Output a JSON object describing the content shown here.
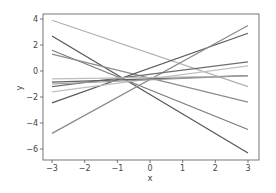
{
  "chart_data": {
    "type": "line",
    "title": "",
    "xlabel": "x",
    "ylabel": "y",
    "xlim": [
      -3.3,
      3.3
    ],
    "ylim": [
      -6.8,
      4.4
    ],
    "x_ticks": [
      -3,
      -2,
      -1,
      0,
      1,
      2,
      3
    ],
    "y_ticks": [
      4,
      2,
      0,
      -2,
      -4,
      -6
    ],
    "x_tick_labels": [
      "−3",
      "−2",
      "−1",
      "0",
      "1",
      "2",
      "3"
    ],
    "y_tick_labels": [
      "4",
      "2",
      "0",
      "−2",
      "−4",
      "−6"
    ],
    "grid": false,
    "legend": null,
    "x": [
      -3,
      3
    ],
    "series": [
      {
        "name": "line1",
        "values": [
          3.9,
          -1.2
        ],
        "color": "#b0b0b0"
      },
      {
        "name": "line2",
        "values": [
          2.7,
          -6.3
        ],
        "color": "#555555"
      },
      {
        "name": "line3",
        "values": [
          1.6,
          -4.5
        ],
        "color": "#7a7a7a"
      },
      {
        "name": "line4",
        "values": [
          1.3,
          -2.4
        ],
        "color": "#8c8c8c"
      },
      {
        "name": "line5",
        "values": [
          -2.45,
          2.9
        ],
        "color": "#5a5a5a"
      },
      {
        "name": "line6",
        "values": [
          -4.8,
          3.5
        ],
        "color": "#8a8a8a"
      },
      {
        "name": "line7",
        "values": [
          -1.2,
          0.7
        ],
        "color": "#6e6e6e"
      },
      {
        "name": "line8",
        "values": [
          -1.6,
          0.4
        ],
        "color": "#c0c0c0"
      },
      {
        "name": "line9",
        "values": [
          -0.85,
          -0.35
        ],
        "color": "#606060"
      },
      {
        "name": "line10",
        "values": [
          -0.6,
          -0.4
        ],
        "color": "#bdbdbd"
      },
      {
        "name": "line11",
        "values": [
          -1.0,
          -0.35
        ],
        "color": "#9a9a9a"
      }
    ]
  }
}
